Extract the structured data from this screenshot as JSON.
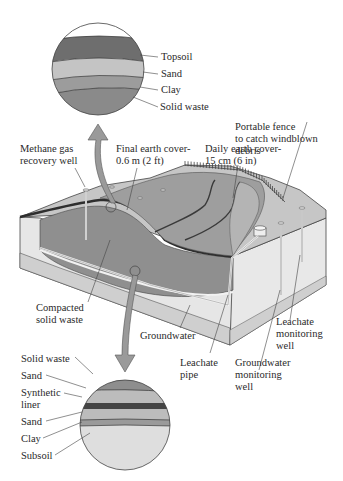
{
  "diagram": {
    "top_inset": {
      "name": "Final cover layers",
      "layers": [
        {
          "label": "Topsoil",
          "color": "#6e6e6e"
        },
        {
          "label": "Sand",
          "color": "#c4c4c4"
        },
        {
          "label": "Clay",
          "color": "#9c9c9c"
        },
        {
          "label": "Solid waste",
          "color": "#8a8a8a"
        }
      ]
    },
    "bottom_inset": {
      "name": "Landfill base liner layers",
      "layers": [
        {
          "label": "Solid waste",
          "color": "#8e8e8e"
        },
        {
          "label": "Sand",
          "color": "#bcbcbc"
        },
        {
          "label": "Synthetic liner",
          "color": "#444444"
        },
        {
          "label": "Sand",
          "color": "#bcbcbc"
        },
        {
          "label": "Clay",
          "color": "#9a9a9a"
        },
        {
          "label": "Subsoil",
          "color": "#dedede"
        }
      ]
    },
    "callouts": {
      "methane": "Methane gas\nrecovery well",
      "final_cover": "Final earth cover-\n0.6 m (2 ft)",
      "daily_cover": "Daily earth cover-\n15 cm (6 in)",
      "fence": "Portable fence\nto catch windblown\ndebris",
      "compacted": "Compacted\nsolid waste",
      "groundwater": "Groundwater",
      "leachate_pipe": "Leachate\npipe",
      "gw_well": "Groundwater\nmonitoring\nwell",
      "leachate_well": "Leachate\nmonitoring\nwell"
    },
    "colors": {
      "line": "#333333",
      "arrow": "#9a9a9a",
      "waste": "#8c8c8c",
      "ground_top": "#c8c8c8",
      "ground_side": "#e4e4e4",
      "groundwater_band": "#d0d0d0"
    }
  }
}
